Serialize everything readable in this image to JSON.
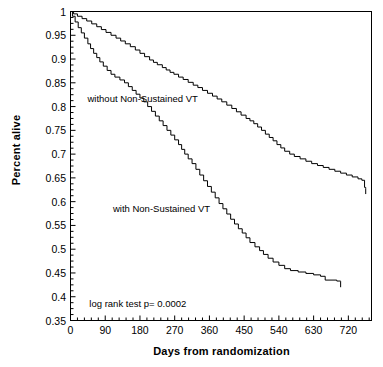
{
  "chart_data": {
    "type": "line",
    "title": "",
    "xlabel": "Days from randomization",
    "ylabel": "Percent alive",
    "xlim": [
      0,
      780
    ],
    "ylim": [
      0.35,
      1.0
    ],
    "grid": false,
    "legend_position": "inline-annotations",
    "xticks": [
      "0",
      "90",
      "180",
      "270",
      "360",
      "450",
      "540",
      "630",
      "720"
    ],
    "xtick_values": [
      0,
      90,
      180,
      270,
      360,
      450,
      540,
      630,
      720
    ],
    "yticks": [
      "1",
      "0.95",
      "0.9",
      "0.85",
      "0.8",
      "0.75",
      "0.7",
      "0.65",
      "0.6",
      "0.55",
      "0.5",
      "0.45",
      "0.4",
      "0.35"
    ],
    "ytick_values": [
      1,
      0.95,
      0.9,
      0.85,
      0.8,
      0.75,
      0.7,
      0.65,
      0.6,
      0.55,
      0.5,
      0.45,
      0.4,
      0.35
    ],
    "annotations": [
      {
        "text": "without Non-Sustained VT",
        "x": 330,
        "y": 0.815
      },
      {
        "text": "with Non-Sustained VT",
        "x": 110,
        "y": 0.585
      },
      {
        "text": "log rank test p= 0.0002",
        "x": 300,
        "y": 0.385
      }
    ],
    "series": [
      {
        "name": "without Non-Sustained VT",
        "color": "#000000",
        "style": "step",
        "points": [
          [
            0,
            1.0
          ],
          [
            8,
            0.995
          ],
          [
            18,
            0.99
          ],
          [
            30,
            0.985
          ],
          [
            42,
            0.98
          ],
          [
            55,
            0.974
          ],
          [
            68,
            0.968
          ],
          [
            80,
            0.962
          ],
          [
            92,
            0.956
          ],
          [
            105,
            0.95
          ],
          [
            118,
            0.944
          ],
          [
            130,
            0.938
          ],
          [
            142,
            0.932
          ],
          [
            155,
            0.926
          ],
          [
            168,
            0.919
          ],
          [
            180,
            0.912
          ],
          [
            192,
            0.905
          ],
          [
            205,
            0.898
          ],
          [
            215,
            0.893
          ],
          [
            225,
            0.888
          ],
          [
            238,
            0.882
          ],
          [
            248,
            0.877
          ],
          [
            258,
            0.872
          ],
          [
            268,
            0.868
          ],
          [
            280,
            0.862
          ],
          [
            292,
            0.857
          ],
          [
            305,
            0.851
          ],
          [
            318,
            0.845
          ],
          [
            330,
            0.84
          ],
          [
            342,
            0.834
          ],
          [
            355,
            0.828
          ],
          [
            368,
            0.822
          ],
          [
            380,
            0.816
          ],
          [
            392,
            0.81
          ],
          [
            405,
            0.803
          ],
          [
            418,
            0.796
          ],
          [
            430,
            0.789
          ],
          [
            442,
            0.782
          ],
          [
            455,
            0.775
          ],
          [
            465,
            0.77
          ],
          [
            475,
            0.764
          ],
          [
            485,
            0.757
          ],
          [
            495,
            0.75
          ],
          [
            505,
            0.742
          ],
          [
            515,
            0.735
          ],
          [
            525,
            0.728
          ],
          [
            535,
            0.72
          ],
          [
            545,
            0.713
          ],
          [
            555,
            0.706
          ],
          [
            568,
            0.7
          ],
          [
            580,
            0.695
          ],
          [
            595,
            0.69
          ],
          [
            610,
            0.685
          ],
          [
            625,
            0.68
          ],
          [
            640,
            0.676
          ],
          [
            655,
            0.672
          ],
          [
            670,
            0.668
          ],
          [
            685,
            0.664
          ],
          [
            700,
            0.66
          ],
          [
            715,
            0.656
          ],
          [
            730,
            0.652
          ],
          [
            745,
            0.648
          ],
          [
            755,
            0.645
          ],
          [
            762,
            0.63
          ],
          [
            765,
            0.628
          ]
        ]
      },
      {
        "name": "with Non-Sustained VT",
        "color": "#000000",
        "style": "step",
        "points": [
          [
            0,
            1.0
          ],
          [
            5,
            0.99
          ],
          [
            12,
            0.978
          ],
          [
            20,
            0.966
          ],
          [
            28,
            0.955
          ],
          [
            36,
            0.944
          ],
          [
            45,
            0.932
          ],
          [
            52,
            0.922
          ],
          [
            60,
            0.912
          ],
          [
            68,
            0.903
          ],
          [
            76,
            0.894
          ],
          [
            85,
            0.885
          ],
          [
            95,
            0.876
          ],
          [
            105,
            0.868
          ],
          [
            115,
            0.862
          ],
          [
            128,
            0.856
          ],
          [
            140,
            0.85
          ],
          [
            150,
            0.842
          ],
          [
            160,
            0.834
          ],
          [
            170,
            0.826
          ],
          [
            180,
            0.818
          ],
          [
            190,
            0.81
          ],
          [
            200,
            0.8
          ],
          [
            210,
            0.79
          ],
          [
            220,
            0.78
          ],
          [
            230,
            0.77
          ],
          [
            240,
            0.76
          ],
          [
            250,
            0.75
          ],
          [
            260,
            0.74
          ],
          [
            270,
            0.73
          ],
          [
            280,
            0.72
          ],
          [
            288,
            0.71
          ],
          [
            296,
            0.7
          ],
          [
            305,
            0.69
          ],
          [
            315,
            0.68
          ],
          [
            325,
            0.668
          ],
          [
            335,
            0.656
          ],
          [
            345,
            0.644
          ],
          [
            355,
            0.632
          ],
          [
            365,
            0.62
          ],
          [
            375,
            0.608
          ],
          [
            385,
            0.596
          ],
          [
            395,
            0.585
          ],
          [
            405,
            0.574
          ],
          [
            415,
            0.563
          ],
          [
            425,
            0.553
          ],
          [
            435,
            0.543
          ],
          [
            445,
            0.534
          ],
          [
            455,
            0.524
          ],
          [
            465,
            0.514
          ],
          [
            478,
            0.505
          ],
          [
            490,
            0.497
          ],
          [
            500,
            0.489
          ],
          [
            512,
            0.481
          ],
          [
            525,
            0.473
          ],
          [
            540,
            0.466
          ],
          [
            555,
            0.459
          ],
          [
            570,
            0.455
          ],
          [
            590,
            0.452
          ],
          [
            610,
            0.449
          ],
          [
            630,
            0.446
          ],
          [
            648,
            0.443
          ],
          [
            660,
            0.435
          ],
          [
            690,
            0.433
          ],
          [
            700,
            0.432
          ]
        ]
      }
    ]
  },
  "axis": {
    "x_label": "Days from randomization",
    "y_label": "Percent alive"
  },
  "annotations": {
    "upper_curve": "without Non-Sustained VT",
    "lower_curve": "with Non-Sustained VT",
    "stat_test": "log rank test p= 0.0002"
  }
}
